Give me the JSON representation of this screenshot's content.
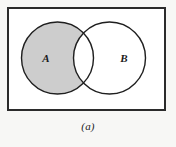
{
  "figure": {
    "caption": "(a)",
    "kind": "venn-diagram",
    "universe_label": "",
    "shaded_description": "A minus B",
    "background_color": "#f7f7f5"
  },
  "universe": {
    "name": "universal-set-rectangle",
    "x": 7,
    "y": 7,
    "width": 159,
    "height": 104,
    "stroke": "#2b2b2b",
    "stroke_width": 2,
    "fill": "#ffffff"
  },
  "sets": [
    {
      "id": "A",
      "label": "A",
      "cx": 57.5,
      "cy": 58,
      "r": 36,
      "shaded": true,
      "fill": "#cdcdcd",
      "stroke": "#1f1f1f",
      "stroke_width": 1.4,
      "label_x": 46,
      "label_y": 62
    },
    {
      "id": "B",
      "label": "B",
      "cx": 109.5,
      "cy": 58,
      "r": 36,
      "shaded": false,
      "fill": "#ffffff",
      "stroke": "#1f1f1f",
      "stroke_width": 1.4,
      "label_x": 124,
      "label_y": 62
    }
  ],
  "regions": {
    "a_only": {
      "name": "region-a-only",
      "shaded": true,
      "color": "#cdcdcd"
    },
    "intersection": {
      "name": "region-a-intersect-b",
      "shaded": false,
      "color": "#ffffff"
    },
    "b_only": {
      "name": "region-b-only",
      "shaded": false,
      "color": "#ffffff"
    },
    "outside": {
      "name": "region-outside-both",
      "shaded": false,
      "color": "#ffffff"
    }
  }
}
